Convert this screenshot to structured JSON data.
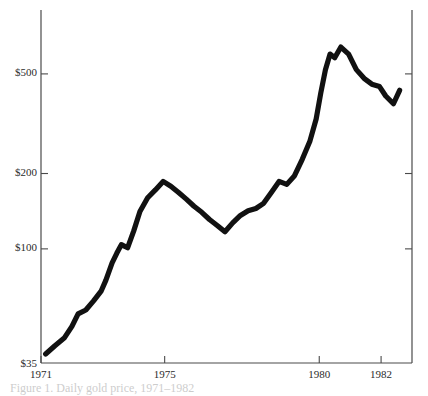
{
  "chart_data": {
    "type": "line",
    "title": "",
    "xlabel": "",
    "ylabel": "",
    "yscale": "log",
    "grid": false,
    "legend": "none",
    "ylim": [
      35,
      900
    ],
    "xlim": [
      1971,
      1983
    ],
    "ytick_labels": [
      "$500",
      "$200",
      "$100",
      "$35"
    ],
    "ytick_values": [
      500,
      200,
      100,
      35
    ],
    "xtick_labels": [
      "1971",
      "1975",
      "1980",
      "1982"
    ],
    "xtick_values": [
      1971,
      1975,
      1980,
      1982
    ],
    "series": [
      {
        "name": "Gold price",
        "x": [
          1971.15,
          1971.45,
          1971.75,
          1972.0,
          1972.2,
          1972.45,
          1972.7,
          1972.95,
          1973.1,
          1973.3,
          1973.45,
          1973.6,
          1973.8,
          1974.0,
          1974.2,
          1974.45,
          1974.7,
          1974.95,
          1975.2,
          1975.45,
          1975.7,
          1975.95,
          1976.2,
          1976.45,
          1976.7,
          1976.95,
          1977.2,
          1977.45,
          1977.7,
          1977.95,
          1978.2,
          1978.45,
          1978.7,
          1978.95,
          1979.2,
          1979.45,
          1979.7,
          1979.9,
          1980.05,
          1980.2,
          1980.35,
          1980.5,
          1980.7,
          1980.95,
          1981.2,
          1981.45,
          1981.7,
          1981.95,
          1982.15,
          1982.4,
          1982.6
        ],
        "values": [
          38,
          41,
          44,
          49,
          55,
          57,
          62,
          68,
          75,
          88,
          96,
          104,
          101,
          118,
          141,
          160,
          172,
          186,
          178,
          168,
          158,
          148,
          140,
          131,
          124,
          117,
          127,
          136,
          142,
          145,
          152,
          168,
          186,
          181,
          196,
          228,
          270,
          330,
          420,
          520,
          600,
          580,
          640,
          600,
          520,
          480,
          455,
          445,
          408,
          380,
          430
        ]
      }
    ]
  },
  "caption": {
    "text": "Figure 1. Daily gold price, 1971–1982"
  }
}
